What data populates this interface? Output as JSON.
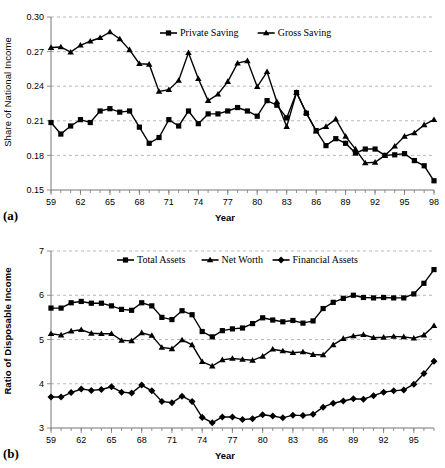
{
  "chart_data": [
    {
      "id": "panel-a",
      "type": "line",
      "panel_label": "(a)",
      "title": "",
      "xlabel": "Year",
      "ylabel": "Share of National Income",
      "xlim": [
        59,
        98
      ],
      "ylim": [
        0.15,
        0.3
      ],
      "yticks": [
        "0.15",
        "0.18",
        "0.21",
        "0.24",
        "0.27",
        "0.30"
      ],
      "ytick_values": [
        0.15,
        0.18,
        0.21,
        0.24,
        0.27,
        0.3
      ],
      "xticks": [
        "59",
        "62",
        "65",
        "68",
        "71",
        "74",
        "77",
        "80",
        "83",
        "86",
        "89",
        "92",
        "95",
        "98"
      ],
      "xtick_values": [
        59,
        62,
        65,
        68,
        71,
        74,
        77,
        80,
        83,
        86,
        89,
        92,
        95,
        98
      ],
      "grid": true,
      "legend_position": "top-center",
      "x": [
        59,
        60,
        61,
        62,
        63,
        64,
        65,
        66,
        67,
        68,
        69,
        70,
        71,
        72,
        73,
        74,
        75,
        76,
        77,
        78,
        79,
        80,
        81,
        82,
        83,
        84,
        85,
        86,
        87,
        88,
        89,
        90,
        91,
        92,
        93,
        94,
        95,
        96,
        97,
        98
      ],
      "series": [
        {
          "name": "Private Saving",
          "marker": "square",
          "values": [
            0.2085,
            0.1985,
            0.2055,
            0.211,
            0.2085,
            0.2185,
            0.2205,
            0.2175,
            0.2185,
            0.2045,
            0.1905,
            0.1955,
            0.211,
            0.2055,
            0.2185,
            0.2075,
            0.216,
            0.216,
            0.2185,
            0.2215,
            0.2185,
            0.214,
            0.2275,
            0.2235,
            0.2125,
            0.2345,
            0.2165,
            0.2015,
            0.1885,
            0.1945,
            0.1905,
            0.182,
            0.1855,
            0.1855,
            0.18,
            0.1805,
            0.1815,
            0.1755,
            0.171,
            0.158
          ]
        },
        {
          "name": "Gross Saving",
          "marker": "triangle",
          "values": [
            0.2735,
            0.274,
            0.2695,
            0.2755,
            0.279,
            0.282,
            0.287,
            0.281,
            0.2715,
            0.2595,
            0.259,
            0.2355,
            0.237,
            0.245,
            0.269,
            0.2465,
            0.2275,
            0.233,
            0.244,
            0.26,
            0.262,
            0.2395,
            0.2525,
            0.2265,
            0.205,
            0.2345,
            0.217,
            0.201,
            0.205,
            0.2115,
            0.1965,
            0.1855,
            0.1735,
            0.174,
            0.18,
            0.188,
            0.1965,
            0.1995,
            0.2065,
            0.211
          ]
        }
      ]
    },
    {
      "id": "panel-b",
      "type": "line",
      "panel_label": "(b)",
      "title": "",
      "xlabel": "Year",
      "ylabel": "Ratio of Disposable Income",
      "xlim": [
        59,
        97
      ],
      "ylim": [
        3,
        7
      ],
      "yticks": [
        "3",
        "4",
        "5",
        "6",
        "7"
      ],
      "ytick_values": [
        3,
        4,
        5,
        6,
        7
      ],
      "xticks": [
        "59",
        "62",
        "65",
        "68",
        "71",
        "74",
        "77",
        "80",
        "83",
        "86",
        "89",
        "92",
        "95"
      ],
      "xtick_values": [
        59,
        62,
        65,
        68,
        71,
        74,
        77,
        80,
        83,
        86,
        89,
        92,
        95
      ],
      "grid": true,
      "legend_position": "top-center",
      "x": [
        59,
        60,
        61,
        62,
        63,
        64,
        65,
        66,
        67,
        68,
        69,
        70,
        71,
        72,
        73,
        74,
        75,
        76,
        77,
        78,
        79,
        80,
        81,
        82,
        83,
        84,
        85,
        86,
        87,
        88,
        89,
        90,
        91,
        92,
        93,
        94,
        95,
        96,
        97
      ],
      "series": [
        {
          "name": "Total Assets",
          "marker": "square",
          "values": [
            5.71,
            5.71,
            5.83,
            5.86,
            5.82,
            5.82,
            5.76,
            5.68,
            5.66,
            5.83,
            5.76,
            5.5,
            5.45,
            5.65,
            5.56,
            5.18,
            5.06,
            5.2,
            5.24,
            5.26,
            5.36,
            5.49,
            5.44,
            5.4,
            5.43,
            5.37,
            5.42,
            5.7,
            5.84,
            5.93,
            6.0,
            5.95,
            5.94,
            5.95,
            5.94,
            5.94,
            6.03,
            6.27,
            6.58
          ]
        },
        {
          "name": "Net Worth",
          "marker": "triangle",
          "values": [
            5.13,
            5.1,
            5.19,
            5.22,
            5.14,
            5.13,
            5.13,
            4.98,
            4.97,
            5.15,
            5.09,
            4.82,
            4.79,
            4.99,
            4.88,
            4.5,
            4.4,
            4.54,
            4.57,
            4.55,
            4.53,
            4.62,
            4.78,
            4.74,
            4.7,
            4.72,
            4.66,
            4.65,
            4.88,
            5.02,
            5.08,
            5.11,
            5.04,
            5.05,
            5.07,
            5.06,
            5.03,
            5.1,
            5.31,
            5.59
          ]
        },
        {
          "name": "Financial Assets",
          "marker": "diamond",
          "values": [
            3.7,
            3.7,
            3.8,
            3.88,
            3.85,
            3.87,
            3.93,
            3.81,
            3.79,
            3.97,
            3.84,
            3.6,
            3.57,
            3.72,
            3.6,
            3.24,
            3.12,
            3.25,
            3.25,
            3.19,
            3.21,
            3.3,
            3.27,
            3.23,
            3.29,
            3.28,
            3.31,
            3.47,
            3.56,
            3.61,
            3.66,
            3.65,
            3.73,
            3.81,
            3.84,
            3.86,
            3.99,
            4.23,
            4.51
          ]
        }
      ]
    }
  ]
}
